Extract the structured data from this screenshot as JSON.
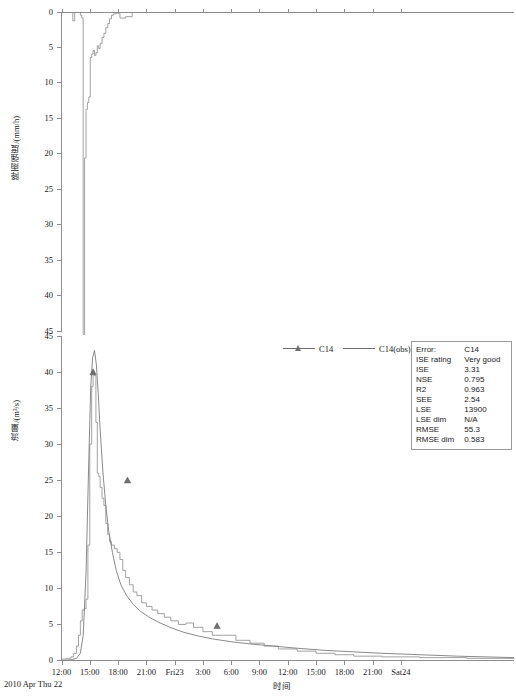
{
  "figure": {
    "x_axis_title": "时间",
    "date_origin_label": "2010 Apr Thu 22",
    "x_tick_labels": [
      "12:00",
      "15:00",
      "18:00",
      "21:00",
      "Fri23",
      "3:00",
      "6:00",
      "9:00",
      "12:00",
      "15:00",
      "18:00",
      "21:00",
      "Sat24"
    ]
  },
  "legend": {
    "entries": [
      {
        "label": "C14",
        "style": "line-with-triangle-marker"
      },
      {
        "label": "C14(obs)",
        "style": "solid-line"
      }
    ]
  },
  "stats": {
    "rows": [
      {
        "key": "Error:",
        "value": "C14"
      },
      {
        "key": "ISE rating",
        "value": "Very good"
      },
      {
        "key": "ISE",
        "value": "3.31"
      },
      {
        "key": "NSE",
        "value": "0.795"
      },
      {
        "key": "R2",
        "value": "0.963"
      },
      {
        "key": "SEE",
        "value": "2.54"
      },
      {
        "key": "LSE",
        "value": "13900"
      },
      {
        "key": "LSE dim",
        "value": "N/A"
      },
      {
        "key": "RMSE",
        "value": "55.3"
      },
      {
        "key": "RMSE dim",
        "value": "0.583"
      }
    ]
  },
  "chart_data": [
    {
      "type": "area",
      "id": "rainfall-hyetograph",
      "title": "",
      "xlabel": "时间",
      "ylabel": "降雨强度/(mm/h)",
      "y_inverted": true,
      "ylim": [
        0,
        46
      ],
      "yticks": [
        0,
        5,
        10,
        15,
        20,
        25,
        30,
        35,
        40,
        45
      ],
      "xlim_hours": [
        12,
        60
      ],
      "x_ticks_hours": [
        12,
        15,
        18,
        21,
        24,
        27,
        30,
        33,
        36,
        39,
        42,
        45,
        48
      ],
      "x_tick_labels": [
        "12:00",
        "15:00",
        "18:00",
        "21:00",
        "Fri23",
        "3:00",
        "6:00",
        "9:00",
        "12:00",
        "15:00",
        "18:00",
        "21:00",
        "Sat24"
      ],
      "grid": false,
      "series": [
        {
          "name": "rainfall",
          "x_hours": [
            12.0,
            13.0,
            13.2,
            13.4,
            13.6,
            13.8,
            14.0,
            14.15,
            14.3,
            14.45,
            14.6,
            14.75,
            14.9,
            15.05,
            15.2,
            15.35,
            15.5,
            15.65,
            15.8,
            15.95,
            16.1,
            16.3,
            16.5,
            16.7,
            16.9,
            17.1,
            17.3,
            17.5,
            17.8,
            18.2,
            18.8,
            19.5,
            20.5,
            24.0,
            30.0,
            36.0,
            48.0,
            60.0
          ],
          "values": [
            0.0,
            0.0,
            1.2,
            0.0,
            0.0,
            0.0,
            0.4,
            0.8,
            46.5,
            21.0,
            14.0,
            13.0,
            12.2,
            6.5,
            6.0,
            5.5,
            6.2,
            5.8,
            4.8,
            5.2,
            4.5,
            3.6,
            3.0,
            2.2,
            1.6,
            0.9,
            0.4,
            0.2,
            0.1,
            0.8,
            0.6,
            0.0,
            0.0,
            0.0,
            0.0,
            0.0,
            0.0,
            0.0
          ]
        }
      ]
    },
    {
      "type": "line",
      "id": "discharge-hydrograph",
      "title": "",
      "xlabel": "时间",
      "ylabel": "流量/(m³/s)",
      "y_inverted": false,
      "ylim": [
        0,
        45
      ],
      "yticks": [
        0,
        5,
        10,
        15,
        20,
        25,
        30,
        35,
        40,
        45
      ],
      "xlim_hours": [
        12,
        60
      ],
      "x_ticks_hours": [
        12,
        15,
        18,
        21,
        24,
        27,
        30,
        33,
        36,
        39,
        42,
        45,
        48
      ],
      "x_tick_labels": [
        "12:00",
        "15:00",
        "18:00",
        "21:00",
        "Fri23",
        "3:00",
        "6:00",
        "9:00",
        "12:00",
        "15:00",
        "18:00",
        "21:00",
        "Sat24"
      ],
      "grid": false,
      "series": [
        {
          "name": "C14",
          "marker": "triangle",
          "x_hours": [
            12.0,
            13.0,
            13.6,
            14.0,
            14.3,
            14.6,
            14.9,
            15.1,
            15.3,
            15.5,
            15.7,
            15.9,
            16.1,
            16.4,
            16.7,
            17.0,
            17.4,
            17.8,
            18.3,
            18.9,
            19.6,
            20.4,
            21.3,
            22.3,
            23.5,
            25.0,
            26.5,
            28.0,
            30.0,
            32.0,
            34.5,
            37.0,
            40.0,
            43.0,
            46.0,
            50.0,
            54.0,
            60.0
          ],
          "values": [
            0.0,
            0.1,
            0.3,
            1.0,
            3.5,
            12.0,
            28.0,
            38.0,
            42.0,
            43.0,
            41.0,
            37.0,
            32.0,
            26.0,
            21.5,
            18.0,
            15.0,
            12.5,
            10.5,
            9.0,
            7.8,
            6.8,
            6.0,
            5.3,
            4.6,
            3.9,
            3.4,
            3.0,
            2.6,
            2.3,
            2.0,
            1.7,
            1.4,
            1.2,
            1.0,
            0.8,
            0.6,
            0.4
          ],
          "marker_x_hours": [
            15.35,
            19.0,
            28.5
          ],
          "marker_values": [
            40.0,
            25.0,
            4.8
          ]
        },
        {
          "name": "C14(obs)",
          "marker": "none",
          "step": true,
          "x_hours": [
            12.0,
            12.5,
            13.0,
            13.3,
            13.6,
            13.8,
            14.0,
            14.2,
            14.4,
            14.6,
            14.8,
            15.0,
            15.2,
            15.35,
            15.5,
            15.65,
            15.8,
            15.95,
            16.1,
            16.3,
            16.5,
            16.7,
            16.9,
            17.1,
            17.3,
            17.6,
            17.9,
            18.2,
            18.5,
            18.8,
            19.2,
            19.6,
            20.0,
            20.5,
            21.0,
            21.6,
            22.2,
            22.9,
            23.6,
            24.4,
            25.2,
            26.0,
            27.0,
            28.0,
            29.2,
            30.5,
            32.0,
            33.5,
            35.0,
            37.0,
            39.0,
            41.0,
            43.0,
            46.0,
            50.0,
            55.0,
            60.0
          ],
          "values": [
            0.2,
            0.3,
            0.5,
            1.0,
            2.0,
            3.5,
            5.5,
            7.0,
            7.2,
            8.5,
            16.0,
            30.0,
            38.0,
            40.0,
            39.5,
            33.0,
            26.0,
            25.5,
            24.0,
            22.5,
            21.5,
            19.0,
            17.5,
            16.5,
            16.0,
            15.5,
            15.0,
            14.0,
            12.5,
            11.5,
            10.5,
            9.5,
            9.0,
            8.0,
            7.5,
            7.0,
            6.5,
            6.0,
            5.5,
            5.0,
            5.2,
            4.6,
            4.0,
            3.5,
            3.5,
            2.8,
            2.4,
            2.0,
            1.6,
            1.3,
            1.0,
            0.8,
            0.6,
            0.5,
            0.4,
            0.3,
            0.2
          ]
        }
      ]
    }
  ]
}
